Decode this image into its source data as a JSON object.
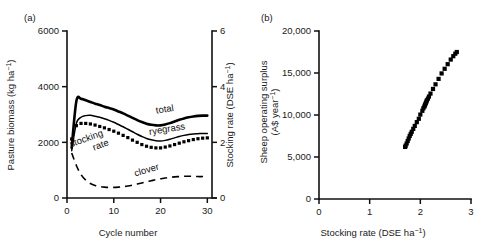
{
  "figure": {
    "background": "#ffffff",
    "ink": "#000000",
    "panels": [
      {
        "key": "a",
        "label": "(a)"
      },
      {
        "key": "b",
        "label": "(b)"
      }
    ]
  },
  "chart_data": [
    {
      "id": "panel-a",
      "panel": "(a)",
      "type": "line",
      "title": "",
      "xlabel": "Cycle number",
      "ylabel": "Pasture biomass (kg ha⁻¹)",
      "y2label": "Stocking rate (DSE ha⁻¹)",
      "xlim": [
        0,
        31
      ],
      "ylim": [
        0,
        6000
      ],
      "y2lim": [
        0,
        6
      ],
      "xticks": [
        0,
        10,
        20,
        30
      ],
      "xticklabels": [
        "0",
        "10",
        "20",
        "30"
      ],
      "yticks": [
        0,
        2000,
        4000,
        6000
      ],
      "yticklabels": [
        "0",
        "2000",
        "4000",
        "6000"
      ],
      "y2ticks": [
        0,
        2,
        4,
        6
      ],
      "y2ticklabels": [
        "0",
        "2",
        "4",
        "6"
      ],
      "grid": false,
      "legend_position": "inline-annotations",
      "x": [
        1,
        2,
        3,
        4,
        5,
        6,
        7,
        8,
        9,
        10,
        11,
        12,
        13,
        14,
        15,
        16,
        17,
        18,
        19,
        20,
        21,
        22,
        23,
        24,
        25,
        26,
        27,
        28,
        29,
        30
      ],
      "series": [
        {
          "name": "total",
          "axis": "left",
          "style": "thick-solid",
          "label_text": "total",
          "label_x": 21.0,
          "label_y": 3080,
          "label_rotation": -9,
          "values": [
            1800,
            3480,
            3560,
            3510,
            3450,
            3390,
            3340,
            3280,
            3230,
            3180,
            3110,
            3040,
            2960,
            2880,
            2800,
            2730,
            2670,
            2630,
            2610,
            2610,
            2640,
            2690,
            2750,
            2810,
            2860,
            2900,
            2930,
            2950,
            2960,
            2960
          ]
        },
        {
          "name": "ryegrass",
          "axis": "left",
          "style": "thin-solid",
          "label_text": "ryegrass",
          "label_x": 21.5,
          "label_y": 2370,
          "label_rotation": -9,
          "values": [
            1700,
            2680,
            2900,
            2960,
            2970,
            2940,
            2900,
            2850,
            2790,
            2720,
            2640,
            2560,
            2470,
            2380,
            2290,
            2210,
            2140,
            2090,
            2060,
            2050,
            2070,
            2110,
            2160,
            2210,
            2250,
            2280,
            2300,
            2310,
            2320,
            2320
          ]
        },
        {
          "name": "clover",
          "axis": "left",
          "style": "dashed",
          "label_text": "clover",
          "label_x": 17.2,
          "label_y": 900,
          "label_rotation": -16,
          "values": [
            1620,
            1170,
            840,
            640,
            520,
            450,
            410,
            390,
            380,
            380,
            390,
            410,
            430,
            460,
            500,
            540,
            580,
            620,
            660,
            690,
            720,
            740,
            760,
            770,
            780,
            780,
            780,
            770,
            770,
            770
          ]
        },
        {
          "name": "stocking rate",
          "axis": "right",
          "style": "dotted-markers",
          "label_text_line1": "stocking",
          "label_text_line2": "rate",
          "label_x": 4.6,
          "label_y": 2050,
          "label_rotation": -20,
          "values": [
            2.12,
            2.6,
            2.68,
            2.68,
            2.66,
            2.62,
            2.57,
            2.52,
            2.46,
            2.4,
            2.33,
            2.25,
            2.17,
            2.08,
            2.0,
            1.92,
            1.86,
            1.82,
            1.8,
            1.8,
            1.83,
            1.87,
            1.92,
            1.97,
            2.02,
            2.06,
            2.1,
            2.13,
            2.15,
            2.16
          ]
        }
      ]
    },
    {
      "id": "panel-b",
      "panel": "(b)",
      "type": "scatter",
      "title": "",
      "xlabel": "Stocking rate (DSE ha⁻¹)",
      "ylabel": "Sheep operating surplus (A$ year⁻¹)",
      "ylabel_line1": "Sheep operating surplus",
      "ylabel_line2": "(A$ year⁻¹)",
      "xlim": [
        0,
        3
      ],
      "ylim": [
        0,
        20000
      ],
      "xticks": [
        0,
        1,
        2,
        3
      ],
      "xticklabels": [
        "0",
        "1",
        "2",
        "3"
      ],
      "yticks": [
        0,
        5000,
        10000,
        15000,
        20000
      ],
      "yticklabels": [
        "0",
        "5,000",
        "10,000",
        "15,000",
        "20,000"
      ],
      "grid": false,
      "legend_position": "none",
      "marker": "square",
      "points": [
        [
          1.7,
          6200
        ],
        [
          1.71,
          6350
        ],
        [
          1.73,
          6600
        ],
        [
          1.75,
          6900
        ],
        [
          1.77,
          7200
        ],
        [
          1.79,
          7500
        ],
        [
          1.81,
          7750
        ],
        [
          1.83,
          8000
        ],
        [
          1.86,
          8350
        ],
        [
          1.89,
          8700
        ],
        [
          1.93,
          9150
        ],
        [
          1.97,
          9550
        ],
        [
          2.0,
          10050
        ],
        [
          2.04,
          10500
        ],
        [
          2.06,
          10800
        ],
        [
          2.08,
          11000
        ],
        [
          2.09,
          11150
        ],
        [
          2.1,
          11300
        ],
        [
          2.11,
          11450
        ],
        [
          2.12,
          11600
        ],
        [
          2.13,
          11750
        ],
        [
          2.15,
          11950
        ],
        [
          2.17,
          12200
        ],
        [
          2.2,
          12550
        ],
        [
          2.25,
          13100
        ],
        [
          2.3,
          13650
        ],
        [
          2.36,
          14300
        ],
        [
          2.42,
          14950
        ],
        [
          2.48,
          15500
        ],
        [
          2.54,
          16050
        ],
        [
          2.6,
          16600
        ],
        [
          2.65,
          17000
        ],
        [
          2.69,
          17300
        ],
        [
          2.72,
          17500
        ]
      ]
    }
  ]
}
